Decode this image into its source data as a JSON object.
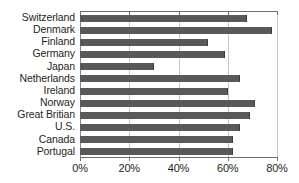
{
  "chart_data": {
    "type": "bar",
    "orientation": "horizontal",
    "title": "",
    "subtitle": "",
    "xlabel": "",
    "ylabel": "",
    "categories": [
      "Switzerland",
      "Denmark",
      "Finland",
      "Germany",
      "Japan",
      "Netherlands",
      "Ireland",
      "Norway",
      "Great Britian",
      "U.S.",
      "Canada",
      "Portugal"
    ],
    "values": [
      68,
      78,
      52,
      59,
      30,
      65,
      60,
      71,
      69,
      65,
      62,
      62
    ],
    "value_unit": "%",
    "xlim": [
      0,
      80
    ],
    "xticks": [
      0,
      20,
      40,
      60,
      80
    ],
    "xtick_labels": [
      "0%",
      "20%",
      "40%",
      "60%",
      "80%"
    ],
    "grid": "vertical",
    "legend": "none",
    "series": [
      {
        "name": "",
        "values": [
          68,
          78,
          52,
          59,
          30,
          65,
          60,
          71,
          69,
          65,
          62,
          62
        ]
      }
    ],
    "annotations": [],
    "colors": {
      "bar_fill": "#595959",
      "bar_edge": "#3d3d3d",
      "gridline": "#c9c9c9",
      "axis": "#6f6f6f",
      "text": "#231f20",
      "background": "#ffffff"
    }
  }
}
